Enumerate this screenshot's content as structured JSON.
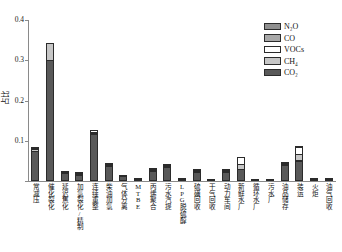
{
  "chart_data": {
    "type": "bar",
    "stacked": true,
    "title": "",
    "xlabel": "",
    "ylabel": "占比",
    "ylim": [
      0,
      0.4
    ],
    "yticks": [
      "0",
      "0.1",
      "0.2",
      "0.3",
      "0.4"
    ],
    "ytick_values": [
      0,
      0.1,
      0.2,
      0.3,
      0.4
    ],
    "grid": false,
    "legend_position": "top-right",
    "categories": [
      "常减压",
      "催化裂化",
      "延迟焦化",
      "加氢裂化/精制",
      "连续重整",
      "柴油加氢",
      "气体分离",
      "MTBE",
      "丙烯聚合",
      "污水汽提",
      "LPG脱硫醇",
      "硫磺回收",
      "干气回收",
      "动力车间",
      "新鲜水厂",
      "循环水厂",
      "污水厂",
      "油品储存",
      "装运",
      "火炬",
      "油气回收"
    ],
    "series": [
      {
        "name": "CO2",
        "label": "CO₂",
        "color": "#595959",
        "values": [
          0.074,
          0.3,
          0.021,
          0.016,
          0.118,
          0.037,
          0.012,
          0.005,
          0.025,
          0.036,
          0.004,
          0.022,
          0.002,
          0.022,
          0.03,
          0.001,
          0.002,
          0.04,
          0.05,
          0.002,
          0.003
        ]
      },
      {
        "name": "CH4",
        "label": "CH₄",
        "color": "#c6c6c6",
        "values": [
          0.006,
          0.045,
          0.001,
          0.001,
          0.002,
          0.002,
          0.001,
          0.0,
          0.001,
          0.002,
          0.001,
          0.001,
          0.0,
          0.001,
          0.014,
          0.0,
          0.0,
          0.001,
          0.018,
          0.0,
          0.0
        ]
      },
      {
        "name": "VOCs",
        "label": "VOCs",
        "color": "#ffffff",
        "values": [
          0.001,
          0.0,
          0.0,
          0.001,
          0.007,
          0.004,
          0.0,
          0.001,
          0.001,
          0.001,
          0.0,
          0.001,
          0.0,
          0.005,
          0.018,
          0.0,
          0.0,
          0.001,
          0.019,
          0.001,
          0.001
        ]
      },
      {
        "name": "CO",
        "label": "CO",
        "color": "#a8a8a8",
        "values": [
          0.001,
          0.0,
          0.0,
          0.0,
          0.0,
          0.0,
          0.0,
          0.0,
          0.0,
          0.0,
          0.0,
          0.0,
          0.0,
          0.0,
          0.0,
          0.0,
          0.0,
          0.0,
          0.001,
          0.0,
          0.0
        ]
      },
      {
        "name": "N2O",
        "label": "N₂O",
        "color": "#8f8f8f",
        "values": [
          0.0,
          0.0,
          0.0,
          0.0,
          0.0,
          0.0,
          0.0,
          0.0,
          0.0,
          0.0,
          0.0,
          0.0,
          0.0,
          0.0,
          0.0,
          0.0,
          0.0,
          0.0,
          0.0,
          0.0,
          0.0
        ]
      }
    ],
    "totals": [
      0.082,
      0.345,
      0.022,
      0.018,
      0.127,
      0.043,
      0.013,
      0.006,
      0.027,
      0.039,
      0.005,
      0.024,
      0.002,
      0.028,
      0.062,
      0.001,
      0.002,
      0.042,
      0.088,
      0.003,
      0.004
    ]
  },
  "legend": {
    "entries": [
      {
        "label": "N₂O",
        "color": "#8f8f8f"
      },
      {
        "label": "CO",
        "color": "#a8a8a8"
      },
      {
        "label": "VOCs",
        "color": "#ffffff"
      },
      {
        "label": "CH₄",
        "color": "#c6c6c6"
      },
      {
        "label": "CO₂",
        "color": "#595959"
      }
    ]
  },
  "axes": {
    "y_title": "占比",
    "y_ticks": [
      "0",
      "0.1",
      "0.2",
      "0.3",
      "0.4"
    ]
  },
  "colors": {
    "axis": "#8a8a8a",
    "text": "#111111",
    "background": "#ffffff",
    "bar_outline": "#2b2b2b"
  }
}
